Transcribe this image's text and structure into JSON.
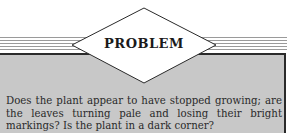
{
  "heading": {
    "label": "PROBLEM"
  },
  "body": {
    "text": "Does the plant appear to have stopped growing; are the leaves turning pale and losing their bright markings? Is the plant in a dark corner?"
  },
  "colors": {
    "panel_background": "#c8c8c8",
    "border": "#2a2a2a",
    "stripes": "#9a9a9a",
    "diamond_fill": "#ffffff"
  }
}
